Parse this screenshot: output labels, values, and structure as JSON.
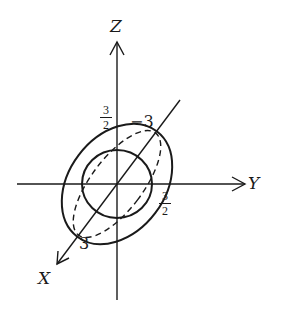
{
  "diagram": {
    "type": "ellipsoid-3d-sketch",
    "stroke_color": "#1a1a1a",
    "background": "#ffffff",
    "axes": {
      "z": {
        "label": "Z"
      },
      "y": {
        "label": "Y"
      },
      "x": {
        "label": "X"
      }
    },
    "tick_labels": {
      "z_intercept": {
        "numerator": "3",
        "denominator": "2"
      },
      "y_intercept": {
        "numerator": "3",
        "denominator": "2"
      },
      "x_positive": "3",
      "x_negative": "−3"
    },
    "curves": [
      {
        "name": "yz-trace-circle",
        "style": "solid"
      },
      {
        "name": "outer-silhouette-ellipse",
        "style": "solid"
      },
      {
        "name": "xy-trace-ellipse",
        "style": "dashed"
      }
    ]
  }
}
